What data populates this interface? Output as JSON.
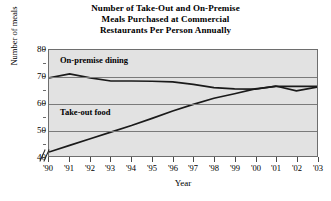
{
  "chart_data": {
    "type": "line",
    "title": "Number of Take-Out and On-Premise Meals Purchased at Commercial Restaurants Per Person Annually",
    "title_lines": [
      "Number of Take-Out and On-Premise",
      "Meals Purchased at Commercial",
      "Restaurants Per Person Annually"
    ],
    "xlabel": "Year",
    "ylabel": "Number of meals",
    "x": [
      "'90",
      "'91",
      "'92",
      "'93",
      "'94",
      "'95",
      "'96",
      "'97",
      "'98",
      "'99",
      "'00",
      "'01",
      "'02",
      "'03"
    ],
    "categories": [
      "'90",
      "'91",
      "'92",
      "'93",
      "'94",
      "'95",
      "'96",
      "'97",
      "'98",
      "'99",
      "'00",
      "'01",
      "'02",
      "'03"
    ],
    "ylim": [
      40,
      80
    ],
    "yticks": [
      40,
      50,
      60,
      70,
      80
    ],
    "ytick_labels": [
      "40",
      "50",
      "60",
      "70",
      "80"
    ],
    "y_axis_break": true,
    "grid": true,
    "grid_axis": "y",
    "legend": "inline-labels",
    "series": [
      {
        "name": "On-premise dining",
        "label": "On-premise dining",
        "values": [
          69.5,
          71.0,
          69.5,
          68.3,
          68.3,
          68.2,
          68.0,
          67.0,
          65.8,
          65.3,
          65.2,
          66.4,
          64.6,
          66.0
        ]
      },
      {
        "name": "Take-out food",
        "label": "Take-out food",
        "values": [
          41.5,
          44.0,
          46.5,
          49.0,
          51.5,
          54.2,
          57.0,
          59.5,
          61.8,
          63.5,
          65.3,
          66.3,
          66.3,
          66.3
        ]
      }
    ],
    "colors": {
      "line": "#1a1a1a",
      "plot_background": "#e2e2e2",
      "gridline": "#7a7a7a",
      "frame": "#6e6e6e"
    }
  }
}
